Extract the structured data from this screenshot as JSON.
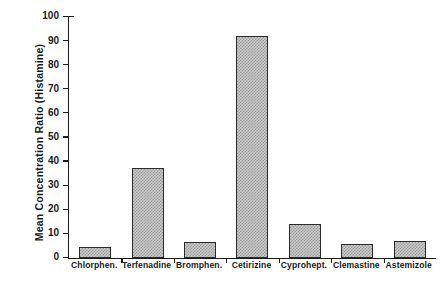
{
  "chart_data": {
    "type": "bar",
    "title": "",
    "xlabel": "",
    "ylabel": "Mean Concentration Ratio  (Histamine)",
    "ylim": [
      0,
      100
    ],
    "yticks": [
      0,
      10,
      20,
      30,
      40,
      50,
      60,
      70,
      80,
      90,
      100
    ],
    "ytick_labels": [
      "0",
      "10",
      "20",
      "30",
      "40",
      "50",
      "60",
      "70",
      "80",
      "90",
      "100"
    ],
    "grid": false,
    "legend": false,
    "categories": [
      "Chlorphen.",
      "Terfenadine",
      "Bromphen.",
      "Cetirizine",
      "Cyprohept.",
      "Clemastine",
      "Astemizole"
    ],
    "values": [
      4.5,
      37.5,
      6.5,
      92,
      14,
      6,
      7
    ],
    "bar_fill_color": "#c9c9c9",
    "bar_pattern": "checker-dither",
    "bar_edge_color": "#2b2b2b",
    "axis_color": "#1a1a1a",
    "background_color": "#ffffff"
  }
}
